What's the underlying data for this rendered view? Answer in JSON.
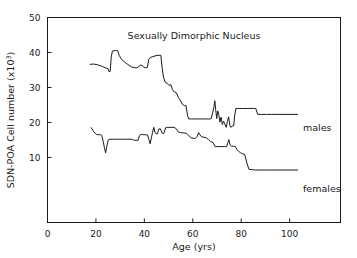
{
  "chart_data": {
    "type": "line",
    "title": "Sexually Dimorphic Nucleus",
    "xlabel": "Age (yrs)",
    "ylabel": "SDN-POA Cell number (x10",
    "ylabel_exponent": "3",
    "ylabel_suffix": ")",
    "xlim": [
      0,
      121
    ],
    "ylim": [
      -8.6,
      50
    ],
    "xticks": [
      0,
      20,
      40,
      60,
      80,
      100
    ],
    "xtick_labels": [
      "0",
      "20",
      "40",
      "60",
      "80",
      "100"
    ],
    "yticks": [
      10,
      20,
      30,
      40,
      50
    ],
    "ytick_labels": [
      "10",
      "20",
      "30",
      "40",
      "50"
    ],
    "grid": false,
    "legend_position": "right-inline",
    "series": [
      {
        "name": "males",
        "label": "males",
        "color": "#1a1a1a",
        "points": [
          [
            17.5,
            36.6
          ],
          [
            19.0,
            36.7
          ],
          [
            20.5,
            36.5
          ],
          [
            22.0,
            36.2
          ],
          [
            23.3,
            35.8
          ],
          [
            24.3,
            35.5
          ],
          [
            25.0,
            35.4
          ],
          [
            25.4,
            34.5
          ],
          [
            25.9,
            34.6
          ],
          [
            26.3,
            38.6
          ],
          [
            26.8,
            40.4
          ],
          [
            28.0,
            40.6
          ],
          [
            29.0,
            40.5
          ],
          [
            29.6,
            39.2
          ],
          [
            30.4,
            38.2
          ],
          [
            31.4,
            37.5
          ],
          [
            32.5,
            36.9
          ],
          [
            33.6,
            36.4
          ],
          [
            34.6,
            35.9
          ],
          [
            35.8,
            35.7
          ],
          [
            36.8,
            35.6
          ],
          [
            37.6,
            35.9
          ],
          [
            38.3,
            36.4
          ],
          [
            39.0,
            36.3
          ],
          [
            39.8,
            35.8
          ],
          [
            40.5,
            35.6
          ],
          [
            41.2,
            35.7
          ],
          [
            41.8,
            38.0
          ],
          [
            42.5,
            38.6
          ],
          [
            43.5,
            38.8
          ],
          [
            44.8,
            39.1
          ],
          [
            46.0,
            39.2
          ],
          [
            46.8,
            39.2
          ],
          [
            47.3,
            35.8
          ],
          [
            47.9,
            33.0
          ],
          [
            48.6,
            31.5
          ],
          [
            49.4,
            31.2
          ],
          [
            50.2,
            30.6
          ],
          [
            50.9,
            30.8
          ],
          [
            51.6,
            29.4
          ],
          [
            52.4,
            28.7
          ],
          [
            53.2,
            28.5
          ],
          [
            54.0,
            27.2
          ],
          [
            54.8,
            26.4
          ],
          [
            55.6,
            25.3
          ],
          [
            56.6,
            24.8
          ],
          [
            57.2,
            24.8
          ],
          [
            57.8,
            22.1
          ],
          [
            58.3,
            21.0
          ],
          [
            59.5,
            21.0
          ],
          [
            61.0,
            21.0
          ],
          [
            62.5,
            21.0
          ],
          [
            64.0,
            21.0
          ],
          [
            65.5,
            21.0
          ],
          [
            66.8,
            21.0
          ],
          [
            67.6,
            21.1
          ],
          [
            68.2,
            22.8
          ],
          [
            68.7,
            24.3
          ],
          [
            69.1,
            26.2
          ],
          [
            69.5,
            23.4
          ],
          [
            69.9,
            21.1
          ],
          [
            70.3,
            23.3
          ],
          [
            70.8,
            22.0
          ],
          [
            71.2,
            20.1
          ],
          [
            71.7,
            21.5
          ],
          [
            72.2,
            19.4
          ],
          [
            72.7,
            20.4
          ],
          [
            73.2,
            19.6
          ],
          [
            73.8,
            18.6
          ],
          [
            74.3,
            20.3
          ],
          [
            74.8,
            21.6
          ],
          [
            75.3,
            19.2
          ],
          [
            75.8,
            18.6
          ],
          [
            76.3,
            19.0
          ],
          [
            76.9,
            19.0
          ],
          [
            77.3,
            21.9
          ],
          [
            77.8,
            24.0
          ],
          [
            79.0,
            24.0
          ],
          [
            80.5,
            24.0
          ],
          [
            82.0,
            24.0
          ],
          [
            83.5,
            24.0
          ],
          [
            85.0,
            24.0
          ],
          [
            86.0,
            24.0
          ],
          [
            86.8,
            22.3
          ],
          [
            88.5,
            22.3
          ],
          [
            90.5,
            22.3
          ],
          [
            92.5,
            22.3
          ],
          [
            94.0,
            22.3
          ]
        ]
      },
      {
        "name": "females",
        "label": "females",
        "color": "#1a1a1a",
        "points": [
          [
            18.0,
            18.6
          ],
          [
            18.8,
            17.7
          ],
          [
            19.5,
            17.0
          ],
          [
            20.2,
            16.6
          ],
          [
            21.0,
            16.5
          ],
          [
            21.8,
            16.5
          ],
          [
            22.4,
            16.3
          ],
          [
            23.0,
            14.6
          ],
          [
            23.5,
            12.8
          ],
          [
            24.0,
            11.3
          ],
          [
            24.6,
            13.5
          ],
          [
            25.1,
            15.0
          ],
          [
            25.8,
            15.2
          ],
          [
            27.0,
            15.2
          ],
          [
            28.5,
            15.2
          ],
          [
            30.0,
            15.2
          ],
          [
            31.5,
            15.2
          ],
          [
            33.0,
            15.2
          ],
          [
            34.2,
            15.2
          ],
          [
            35.0,
            15.2
          ],
          [
            35.8,
            14.9
          ],
          [
            36.6,
            14.9
          ],
          [
            37.4,
            14.9
          ],
          [
            38.0,
            16.3
          ],
          [
            38.7,
            16.6
          ],
          [
            39.6,
            16.5
          ],
          [
            40.5,
            16.5
          ],
          [
            41.3,
            16.4
          ],
          [
            41.9,
            15.1
          ],
          [
            42.4,
            13.9
          ],
          [
            42.9,
            15.6
          ],
          [
            43.4,
            17.2
          ],
          [
            43.9,
            18.6
          ],
          [
            44.4,
            17.1
          ],
          [
            44.9,
            16.8
          ],
          [
            45.4,
            16.7
          ],
          [
            45.9,
            18.1
          ],
          [
            46.6,
            18.2
          ],
          [
            47.3,
            17.0
          ],
          [
            48.0,
            16.8
          ],
          [
            48.8,
            18.5
          ],
          [
            49.6,
            18.6
          ],
          [
            51.0,
            18.6
          ],
          [
            52.3,
            18.6
          ],
          [
            53.2,
            18.2
          ],
          [
            54.0,
            17.3
          ],
          [
            55.0,
            17.1
          ],
          [
            56.2,
            17.0
          ],
          [
            57.4,
            16.9
          ],
          [
            58.4,
            16.2
          ],
          [
            59.3,
            15.6
          ],
          [
            60.2,
            15.5
          ],
          [
            61.0,
            15.4
          ],
          [
            61.8,
            16.0
          ],
          [
            62.4,
            17.1
          ],
          [
            63.0,
            16.4
          ],
          [
            63.8,
            15.8
          ],
          [
            64.6,
            15.8
          ],
          [
            65.6,
            15.6
          ],
          [
            66.5,
            15.1
          ],
          [
            67.4,
            14.5
          ],
          [
            68.3,
            14.3
          ],
          [
            69.2,
            13.1
          ],
          [
            70.5,
            13.1
          ],
          [
            72.0,
            13.1
          ],
          [
            73.2,
            13.1
          ],
          [
            74.0,
            13.1
          ],
          [
            74.5,
            14.3
          ],
          [
            74.9,
            15.1
          ],
          [
            75.4,
            13.6
          ],
          [
            76.0,
            13.2
          ],
          [
            76.8,
            13.2
          ],
          [
            77.6,
            13.1
          ],
          [
            78.3,
            12.2
          ],
          [
            79.0,
            11.7
          ],
          [
            79.8,
            11.3
          ],
          [
            80.6,
            11.0
          ],
          [
            81.4,
            10.9
          ],
          [
            82.0,
            9.3
          ],
          [
            82.6,
            7.8
          ],
          [
            83.2,
            6.6
          ],
          [
            84.5,
            6.5
          ],
          [
            86.0,
            6.4
          ],
          [
            88.0,
            6.4
          ],
          [
            90.0,
            6.4
          ],
          [
            92.0,
            6.4
          ],
          [
            93.5,
            6.4
          ]
        ]
      }
    ]
  }
}
